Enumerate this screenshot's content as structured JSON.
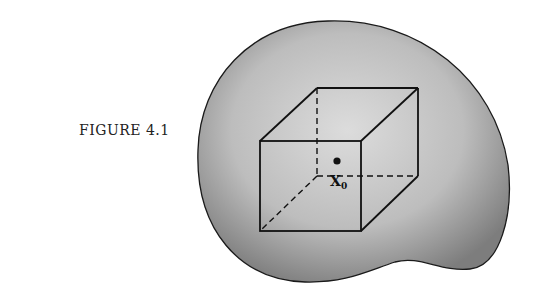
{
  "figure": {
    "caption": "FIGURE 4.1",
    "point_label": "X",
    "point_subscript": "0",
    "colors": {
      "region_fill_light": "#d9d9d9",
      "region_fill_dark": "#8a8a8a",
      "outline": "#1a1a1a",
      "background": "#ffffff"
    },
    "elements": [
      {
        "type": "region",
        "description": "irregular blob-shaped region (shaded)"
      },
      {
        "type": "cube",
        "description": "wireframe cube with hidden edges dashed"
      },
      {
        "type": "point",
        "description": "point x0 at center of cube"
      }
    ]
  }
}
